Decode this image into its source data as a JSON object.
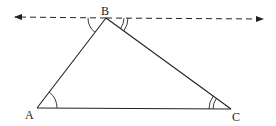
{
  "diagram": {
    "type": "triangle-with-parallel-line",
    "vertices": {
      "A": {
        "label": "A",
        "x": 37,
        "y": 108
      },
      "B": {
        "label": "B",
        "x": 106,
        "y": 18
      },
      "C": {
        "label": "C",
        "x": 231,
        "y": 109
      }
    },
    "parallel_line": {
      "style": "dashed",
      "arrows": "both",
      "through": "B",
      "y": 18,
      "x_start": 15,
      "x_end": 263
    },
    "angle_marks": [
      {
        "at": "A",
        "arcs": 1,
        "between": [
          "AB",
          "AC"
        ]
      },
      {
        "at": "B",
        "arcs": 1,
        "between": [
          "line-left",
          "BA"
        ],
        "note": "alternate to angle A"
      },
      {
        "at": "B",
        "arcs": 2,
        "between": [
          "line-right",
          "BC"
        ],
        "note": "alternate to angle C"
      },
      {
        "at": "C",
        "arcs": 2,
        "between": [
          "CA",
          "CB"
        ]
      }
    ],
    "colors": {
      "stroke": "#222222",
      "background": "#ffffff"
    }
  }
}
